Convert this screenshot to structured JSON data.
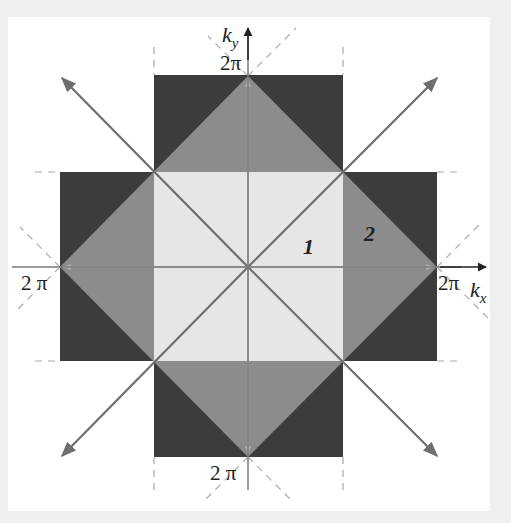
{
  "diagram": {
    "axes": {
      "x_label": "k",
      "x_sub": "x",
      "y_label": "k",
      "y_sub": "y"
    },
    "tick_labels": {
      "top": "2π",
      "bottom": "2 π",
      "left": "2 π",
      "right": "2π"
    },
    "zone_labels": {
      "first": "1",
      "second": "2"
    },
    "colors": {
      "background": "#efefef",
      "panel": "#ffffff",
      "zone1": "#e6e6e6",
      "zone2": "#8c8c8c",
      "zone3": "#3c3c3c",
      "arrows": "#6e6e6e",
      "axes": "#7a7a7a",
      "dashed": "#aaaaaa"
    }
  }
}
